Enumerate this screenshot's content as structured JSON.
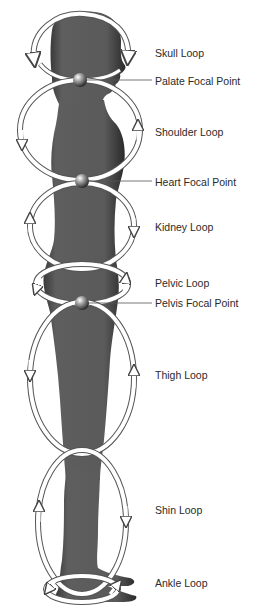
{
  "diagram": {
    "type": "anatomical-flow-diagram",
    "colors": {
      "body": "#5a5a5a",
      "body_shadow": "#2e2e2e",
      "loop_stroke": "#ffffff",
      "loop_outline": "#555555",
      "sphere": "#8a8a8a",
      "text": "#2a2a2a",
      "leader_line": "#555555"
    },
    "focal_points": [
      {
        "id": "palate",
        "label": "Palate Focal Point",
        "x": 80,
        "y": 80
      },
      {
        "id": "heart",
        "label": "Heart Focal Point",
        "x": 82,
        "y": 181
      },
      {
        "id": "pelvis",
        "label": "Pelvis Focal Point",
        "x": 82,
        "y": 303
      }
    ],
    "loops": [
      {
        "id": "skull",
        "label": "Skull Loop",
        "label_y": 47
      },
      {
        "id": "shoulder",
        "label": "Shoulder Loop",
        "label_y": 126
      },
      {
        "id": "kidney",
        "label": "Kidney Loop",
        "label_y": 221
      },
      {
        "id": "pelvic",
        "label": "Pelvic Loop",
        "label_y": 277
      },
      {
        "id": "thigh",
        "label": "Thigh Loop",
        "label_y": 369
      },
      {
        "id": "shin",
        "label": "Shin Loop",
        "label_y": 504
      },
      {
        "id": "ankle",
        "label": "Ankle Loop",
        "label_y": 577
      }
    ]
  },
  "labels": {
    "skull": "Skull Loop",
    "palate": "Palate Focal Point",
    "shoulder": "Shoulder Loop",
    "heart": "Heart Focal Point",
    "kidney": "Kidney Loop",
    "pelvic": "Pelvic Loop",
    "pelvis": "Pelvis Focal Point",
    "thigh": "Thigh Loop",
    "shin": "Shin Loop",
    "ankle": "Ankle Loop"
  }
}
